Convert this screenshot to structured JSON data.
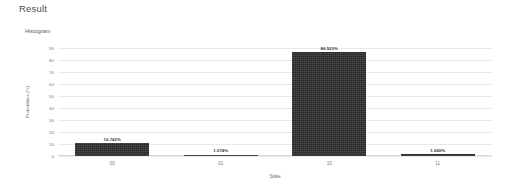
{
  "panel": {
    "heading": "Result"
  },
  "chart_data": {
    "type": "bar",
    "title": "Histogram",
    "xlabel": "State",
    "ylabel": "Probabilities (%)",
    "categories": [
      "00",
      "01",
      "10",
      "11"
    ],
    "values": [
      10.742,
      1.074,
      86.523,
      1.66
    ],
    "value_labels": [
      "10.742%",
      "1.074%",
      "86.523%",
      "1.660%"
    ],
    "ylim": [
      0,
      90
    ],
    "yticks": [
      90,
      80,
      70,
      60,
      50,
      40,
      30,
      20,
      10,
      0
    ],
    "ytick_labels": [
      "90",
      "80",
      "70",
      "60",
      "50",
      "40",
      "30",
      "20",
      "10",
      "0"
    ],
    "grid": true,
    "legend": false,
    "bar_color": "#262626",
    "grid_color": "#e9e9e9"
  }
}
